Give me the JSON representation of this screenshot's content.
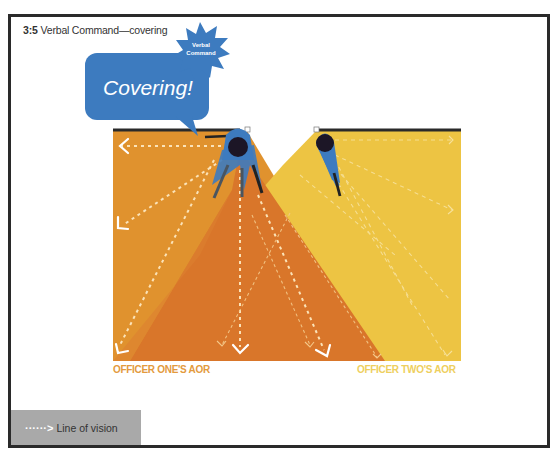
{
  "figure": {
    "number": "3:5",
    "title": "Verbal Command—covering"
  },
  "speech_bubble": {
    "text": "Covering!",
    "color": "#3d7bbf"
  },
  "starburst": {
    "line1": "Verbal",
    "line2": "Command",
    "color": "#3d7bbf"
  },
  "areas": {
    "officer_one": {
      "label": "OFFICER ONE'S AOR",
      "color": "#e0922e",
      "label_color": "#e39a3d"
    },
    "officer_two": {
      "label": "OFFICER TWO'S AOR",
      "color": "#edc443",
      "label_color": "#eecf5e"
    },
    "overlap_color": "#d9762a"
  },
  "officers": [
    {
      "name": "Officer One",
      "role": "covering"
    },
    {
      "name": "Officer Two",
      "role": "advancing"
    }
  ],
  "legend": {
    "arrow": "······>",
    "label": "Line of vision"
  }
}
